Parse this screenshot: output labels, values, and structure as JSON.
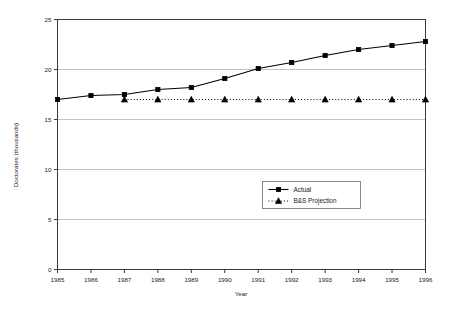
{
  "chart_data": {
    "type": "line",
    "title": "",
    "xlabel": "Year",
    "ylabel": "Doctorates (thousands)",
    "x": [
      1985,
      1986,
      1987,
      1988,
      1989,
      1990,
      1991,
      1992,
      1993,
      1994,
      1995,
      1996
    ],
    "xtick_labels": [
      "1985",
      "1986",
      "1987",
      "1988",
      "1989",
      "1990",
      "1991",
      "1992",
      "1993",
      "1994",
      "1995",
      "1996"
    ],
    "ytick_labels": [
      "0",
      "5",
      "10",
      "15",
      "20",
      "25"
    ],
    "ytick_values": [
      0,
      5,
      10,
      15,
      20,
      25
    ],
    "ylim": [
      0,
      25
    ],
    "xlim": [
      1985,
      1996
    ],
    "grid": "horizontal",
    "legend_position": "center",
    "series": [
      {
        "name": "Actual",
        "marker": "square",
        "line_style": "solid",
        "color": "#000000",
        "x": [
          1985,
          1986,
          1987,
          1988,
          1989,
          1990,
          1991,
          1992,
          1993,
          1994,
          1995,
          1996
        ],
        "values": [
          17.0,
          17.4,
          17.5,
          18.0,
          18.2,
          19.1,
          20.1,
          20.7,
          21.4,
          22.0,
          22.4,
          22.8
        ]
      },
      {
        "name": "B&S Projection",
        "marker": "triangle",
        "line_style": "dotted",
        "color": "#000000",
        "x": [
          1987,
          1988,
          1989,
          1990,
          1991,
          1992,
          1993,
          1994,
          1995,
          1996
        ],
        "values": [
          17.0,
          17.0,
          17.0,
          17.0,
          17.0,
          17.0,
          17.0,
          17.0,
          17.0,
          17.0
        ]
      }
    ],
    "legend": [
      {
        "label": "Actual",
        "marker": "square",
        "line_style": "solid"
      },
      {
        "label": "B&S Projection",
        "marker": "triangle",
        "line_style": "dotted"
      }
    ],
    "colors": {
      "frame": "#3a3a3a",
      "grid": "#b4b4b4",
      "series": "#000000",
      "background": "#ffffff",
      "text": "#1a1a1a"
    }
  }
}
